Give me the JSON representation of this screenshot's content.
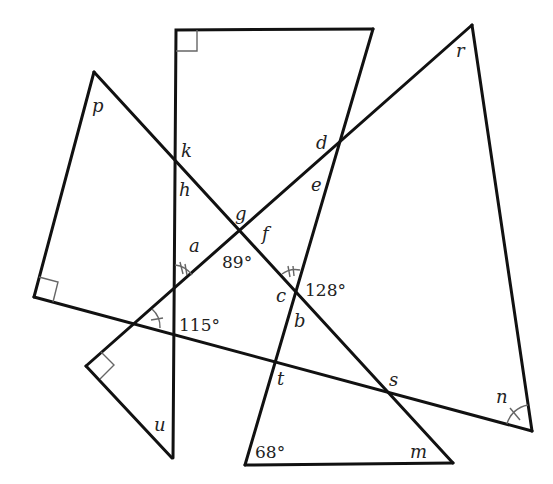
{
  "diagram": {
    "type": "geometry-angle-figure",
    "variable_labels": {
      "p": "p",
      "k": "k",
      "h": "h",
      "g": "g",
      "f": "f",
      "d": "d",
      "e": "e",
      "a": "a",
      "c": "c",
      "b": "b",
      "r": "r",
      "t": "t",
      "s": "s",
      "u": "u",
      "n": "n",
      "m": "m"
    },
    "given_angles": {
      "angle_89": "89°",
      "angle_128": "128°",
      "angle_115": "115°",
      "angle_68": "68°"
    },
    "right_angle_marks": 3,
    "equal_angle_marks": {
      "double_arc": [
        "near a",
        "near c"
      ],
      "single_arc_tick": [
        "near 115°",
        "near n"
      ]
    },
    "colors": {
      "line": "#111111",
      "mark": "#666666",
      "text": "#222222",
      "background": "#ffffff"
    }
  }
}
